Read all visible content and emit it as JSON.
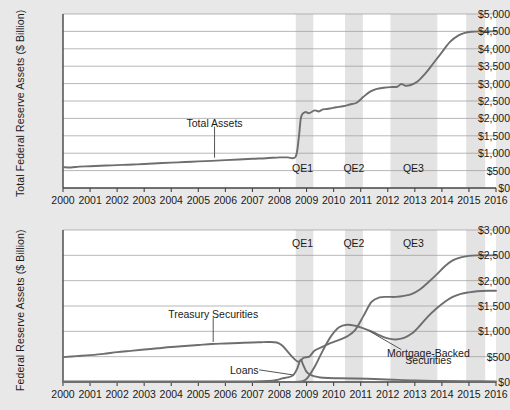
{
  "figure": {
    "background_color": "#e8e8e8",
    "plot_background_color": "#ffffff",
    "line_color": "#6e6e6e",
    "grid_color": "#9a9a9a",
    "axis_color": "#555555",
    "band_color": "#e3e3e3"
  },
  "chart_data": [
    {
      "type": "line",
      "panel": "top",
      "title": "",
      "xlabel": "",
      "ylabel": "Total  Federal Reserve Assets ($ Billion)",
      "xlim": [
        2000,
        2016
      ],
      "ylim": [
        0,
        5000
      ],
      "yticks": [
        "$0",
        "$500",
        "$1,000",
        "$1,500",
        "$2,000",
        "$2,500",
        "$3,000",
        "$3,500",
        "$4,000",
        "$4,500",
        "$5,000"
      ],
      "ytick_values": [
        0,
        500,
        1000,
        1500,
        2000,
        2500,
        3000,
        3500,
        4000,
        4500,
        5000
      ],
      "xticks": [
        "2000",
        "2001",
        "2002",
        "2003",
        "2004",
        "2005",
        "2006",
        "2007",
        "2008",
        "2009",
        "2010",
        "2011",
        "2012",
        "2013",
        "2014",
        "2015",
        "2016"
      ],
      "xtick_values": [
        2000,
        2001,
        2002,
        2003,
        2004,
        2005,
        2006,
        2007,
        2008,
        2009,
        2010,
        2011,
        2012,
        2013,
        2014,
        2015,
        2016
      ],
      "grid": true,
      "legend": "none",
      "annotations": [
        {
          "text": "Total Assets",
          "x": 2005.6,
          "y": 1850,
          "leader_to_y": 870
        },
        {
          "text": "QE1",
          "x": 2008.85,
          "y": 560
        },
        {
          "text": "QE2",
          "x": 2010.75,
          "y": 560
        },
        {
          "text": "QE3",
          "x": 2012.95,
          "y": 560
        }
      ],
      "bands": [
        {
          "label": "QE1",
          "x0": 2008.6,
          "x1": 2009.25
        },
        {
          "label": "QE2",
          "x0": 2010.42,
          "x1": 2011.08
        },
        {
          "label": "QE3",
          "x0": 2012.1,
          "x1": 2013.83
        },
        {
          "label": "",
          "x0": 2014.9,
          "x1": 2015.6
        }
      ],
      "series": [
        {
          "name": "Total Assets",
          "x": [
            2000.0,
            2000.3,
            2000.6,
            2001.0,
            2001.4,
            2001.8,
            2002.2,
            2002.6,
            2003.0,
            2003.5,
            2004.0,
            2004.5,
            2005.0,
            2005.5,
            2006.0,
            2006.5,
            2007.0,
            2007.5,
            2008.0,
            2008.3,
            2008.6,
            2008.72,
            2008.8,
            2008.95,
            2009.1,
            2009.3,
            2009.45,
            2009.6,
            2009.75,
            2009.9,
            2010.1,
            2010.35,
            2010.6,
            2010.85,
            2011.1,
            2011.35,
            2011.6,
            2011.85,
            2012.1,
            2012.35,
            2012.5,
            2012.65,
            2012.85,
            2013.1,
            2013.4,
            2013.7,
            2014.0,
            2014.3,
            2014.6,
            2014.85,
            2015.1,
            2015.4,
            2015.7,
            2016.0
          ],
          "y": [
            600,
            590,
            615,
            625,
            640,
            650,
            665,
            675,
            690,
            710,
            730,
            745,
            765,
            780,
            800,
            820,
            840,
            855,
            880,
            880,
            900,
            1500,
            2050,
            2180,
            2150,
            2230,
            2200,
            2260,
            2270,
            2290,
            2320,
            2350,
            2400,
            2450,
            2620,
            2770,
            2850,
            2880,
            2900,
            2910,
            2990,
            2940,
            2960,
            3060,
            3300,
            3600,
            3900,
            4200,
            4380,
            4460,
            4490,
            4500,
            4500,
            4500
          ]
        }
      ]
    },
    {
      "type": "line",
      "panel": "bottom",
      "title": "",
      "xlabel": "",
      "ylabel": "Federal Reserve Assets ($ Billion)",
      "xlim": [
        2000,
        2016
      ],
      "ylim": [
        0,
        3000
      ],
      "yticks": [
        "$0",
        "$500",
        "$1,000",
        "$1,500",
        "$2,000",
        "$2,500",
        "$3,000"
      ],
      "ytick_values": [
        0,
        500,
        1000,
        1500,
        2000,
        2500,
        3000
      ],
      "xticks": [
        "2000",
        "2001",
        "2002",
        "2003",
        "2004",
        "2005",
        "2006",
        "2007",
        "2008",
        "2009",
        "2010",
        "2011",
        "2012",
        "2013",
        "2014",
        "2015",
        "2016"
      ],
      "xtick_values": [
        2000,
        2001,
        2002,
        2003,
        2004,
        2005,
        2006,
        2007,
        2008,
        2009,
        2010,
        2011,
        2012,
        2013,
        2014,
        2015,
        2016
      ],
      "grid": true,
      "legend": "none",
      "annotations": [
        {
          "text": "Treasury Securities",
          "x": 2005.55,
          "y": 1330,
          "leader_to_y": 790
        },
        {
          "text": "Loans",
          "x": 2006.7,
          "y": 220
        },
        {
          "text": "Mortgage-Backed",
          "x": 2013.5,
          "y": 560
        },
        {
          "text": "Securities",
          "x": 2013.5,
          "y": 420
        },
        {
          "text": "QE1",
          "x": 2008.85,
          "y": 2720
        },
        {
          "text": "QE2",
          "x": 2010.75,
          "y": 2720
        },
        {
          "text": "QE3",
          "x": 2012.95,
          "y": 2720
        }
      ],
      "bands": [
        {
          "label": "QE1",
          "x0": 2008.6,
          "x1": 2009.25
        },
        {
          "label": "QE2",
          "x0": 2010.42,
          "x1": 2011.08
        },
        {
          "label": "QE3",
          "x0": 2012.1,
          "x1": 2013.83
        },
        {
          "label": "",
          "x0": 2014.9,
          "x1": 2015.6
        }
      ],
      "series": [
        {
          "name": "Treasury Securities",
          "x": [
            2000.0,
            2000.5,
            2001.0,
            2001.5,
            2002.0,
            2002.5,
            2003.0,
            2003.5,
            2004.0,
            2004.5,
            2005.0,
            2005.5,
            2006.0,
            2006.5,
            2007.0,
            2007.3,
            2007.6,
            2007.9,
            2008.1,
            2008.3,
            2008.5,
            2008.7,
            2008.9,
            2009.1,
            2009.3,
            2009.6,
            2009.9,
            2010.2,
            2010.5,
            2010.8,
            2011.1,
            2011.4,
            2011.7,
            2012.0,
            2012.3,
            2012.6,
            2012.9,
            2013.2,
            2013.5,
            2013.8,
            2014.1,
            2014.4,
            2014.7,
            2015.0,
            2015.3,
            2015.7,
            2016.0
          ],
          "y": [
            490,
            510,
            530,
            555,
            590,
            615,
            640,
            665,
            690,
            710,
            730,
            750,
            760,
            770,
            780,
            785,
            790,
            780,
            720,
            600,
            480,
            400,
            480,
            500,
            620,
            700,
            770,
            830,
            900,
            1030,
            1300,
            1580,
            1670,
            1680,
            1680,
            1700,
            1740,
            1830,
            1970,
            2120,
            2280,
            2400,
            2460,
            2490,
            2500,
            2500,
            2500
          ]
        },
        {
          "name": "Mortgage-Backed Securities",
          "x": [
            2000.0,
            2005.0,
            2007.0,
            2008.0,
            2008.5,
            2008.8,
            2009.0,
            2009.3,
            2009.6,
            2009.9,
            2010.2,
            2010.5,
            2010.8,
            2011.1,
            2011.4,
            2011.7,
            2012.0,
            2012.3,
            2012.6,
            2012.9,
            2013.2,
            2013.5,
            2013.8,
            2014.1,
            2014.4,
            2014.7,
            2015.0,
            2015.3,
            2015.7,
            2016.0
          ],
          "y": [
            0,
            0,
            0,
            0,
            0,
            10,
            60,
            300,
            620,
            900,
            1080,
            1130,
            1110,
            1060,
            1000,
            920,
            860,
            840,
            870,
            960,
            1120,
            1300,
            1450,
            1580,
            1680,
            1740,
            1770,
            1790,
            1800,
            1800
          ]
        },
        {
          "name": "Loans",
          "x": [
            2000.0,
            2005.0,
            2007.0,
            2007.6,
            2007.9,
            2008.1,
            2008.3,
            2008.5,
            2008.65,
            2008.78,
            2008.88,
            2009.0,
            2009.15,
            2009.3,
            2009.5,
            2009.8,
            2010.2,
            2010.8,
            2011.5,
            2012.2,
            2013.0,
            2014.0,
            2015.0,
            2016.0
          ],
          "y": [
            10,
            10,
            12,
            20,
            40,
            70,
            90,
            130,
            260,
            440,
            330,
            200,
            140,
            110,
            90,
            80,
            75,
            70,
            60,
            45,
            30,
            20,
            15,
            12
          ]
        }
      ]
    }
  ]
}
